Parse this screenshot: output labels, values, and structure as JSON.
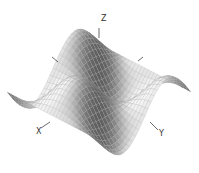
{
  "chart_data": {
    "type": "surface3d",
    "title": "",
    "function": "z = sin(x) * cos(y)",
    "x_range": [
      -3.14159,
      3.14159
    ],
    "y_range": [
      -3.14159,
      3.14159
    ],
    "z_range": [
      -1,
      1
    ],
    "grid_resolution": 30,
    "axes": {
      "x_label": "X",
      "y_label": "Y",
      "z_label": "Z"
    },
    "colormap": "gray",
    "shading": "lit-mesh",
    "grid": false,
    "legend": false
  },
  "colors": {
    "background": "#ffffff",
    "mesh_line": "#9a9a9a",
    "axis": "#444444"
  },
  "labels": {
    "x": "X",
    "y": "Y",
    "z": "Z"
  }
}
